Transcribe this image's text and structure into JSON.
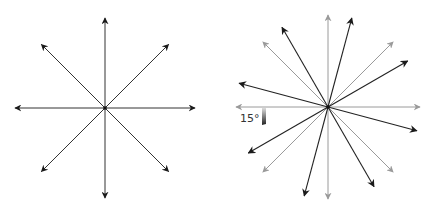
{
  "diagrams": [
    {
      "id": "left-star",
      "center": [
        105,
        108
      ],
      "length": 90,
      "arrows": [
        {
          "angle_deg": 0,
          "color": "#222222"
        },
        {
          "angle_deg": 45,
          "color": "#222222"
        },
        {
          "angle_deg": 90,
          "color": "#222222"
        },
        {
          "angle_deg": 135,
          "color": "#222222"
        },
        {
          "angle_deg": 180,
          "color": "#222222"
        },
        {
          "angle_deg": 225,
          "color": "#222222"
        },
        {
          "angle_deg": 270,
          "color": "#222222"
        },
        {
          "angle_deg": 315,
          "color": "#222222"
        }
      ]
    },
    {
      "id": "right-star",
      "center": [
        328,
        107
      ],
      "length": 92,
      "gray_arrows": {
        "color": "#9a9a9a",
        "angles_deg": [
          0,
          45,
          90,
          135,
          180,
          225,
          270,
          315
        ]
      },
      "black_arrows": {
        "color": "#1a1a1a",
        "rotation_deg": -15,
        "angles_deg": [
          -15,
          30,
          75,
          120,
          165,
          210,
          255,
          300
        ]
      },
      "angle_annotation": {
        "label": "15°"
      }
    }
  ]
}
